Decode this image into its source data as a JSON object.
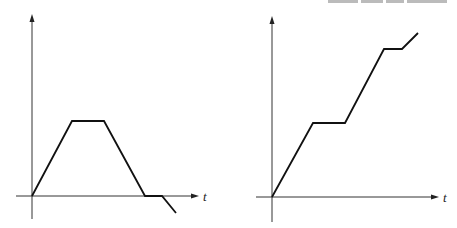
{
  "figure": {
    "panels": [
      {
        "id": "left",
        "x_axis_label": "t",
        "y_axis_label": "",
        "axis": {
          "origin": [
            32,
            196
          ],
          "x_start": 16,
          "x_end": 198,
          "y_top": 15,
          "y_bottom": 219
        },
        "label_pos": [
          203,
          200
        ],
        "path": [
          [
            32,
            196
          ],
          [
            72,
            121
          ],
          [
            104,
            121
          ],
          [
            145,
            196
          ],
          [
            162,
            196
          ],
          [
            176,
            213
          ]
        ]
      },
      {
        "id": "right",
        "x_axis_label": "t",
        "y_axis_label": "",
        "axis": {
          "origin": [
            272,
            197
          ],
          "x_start": 256,
          "x_end": 438,
          "y_top": 17,
          "y_bottom": 222
        },
        "label_pos": [
          443,
          201
        ],
        "path": [
          [
            272,
            197
          ],
          [
            313,
            123
          ],
          [
            345,
            123
          ],
          [
            384,
            49
          ],
          [
            402,
            49
          ],
          [
            418,
            33
          ]
        ]
      }
    ]
  },
  "chart_data": [
    {
      "type": "line",
      "title": "",
      "xlabel": "t",
      "ylabel": "",
      "grid": false,
      "legend": null,
      "x": [
        0,
        1,
        1.8,
        2.85,
        3.25,
        3.6
      ],
      "values": [
        0,
        1,
        1,
        0,
        0,
        -0.23
      ],
      "notes": "Rise linearly, flat plateau, linear fall to zero, brief flat at zero, then falls below axis"
    },
    {
      "type": "line",
      "title": "",
      "xlabel": "t",
      "ylabel": "",
      "grid": false,
      "legend": null,
      "x": [
        0,
        1,
        1.8,
        2.75,
        3.2,
        3.6
      ],
      "values": [
        0,
        1,
        1,
        2,
        2,
        2.2
      ],
      "notes": "Staircase-like increase: rise, plateau, rise, plateau, rise (slower)"
    }
  ],
  "header_fragment": {
    "text": ""
  }
}
